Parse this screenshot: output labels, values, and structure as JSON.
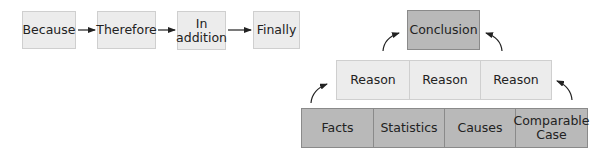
{
  "sequence": {
    "steps": [
      "Because",
      "Therefore",
      "In\naddition",
      "Finally"
    ]
  },
  "pyramid": {
    "conclusion": "Conclusion",
    "reasons": [
      "Reason",
      "Reason",
      "Reason"
    ],
    "evidence": [
      "Facts",
      "Statistics",
      "Causes",
      "Comparable\nCase"
    ]
  },
  "colors": {
    "light_fill": "#ececec",
    "dark_fill": "#b9b9b9",
    "arrow": "#222222"
  }
}
